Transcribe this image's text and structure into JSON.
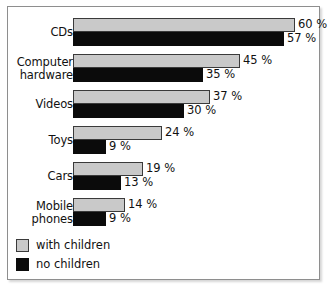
{
  "chart_data": {
    "type": "bar",
    "orientation": "horizontal",
    "title": "",
    "subtitle": "",
    "xlabel": "",
    "ylabel": "",
    "xlim": [
      0,
      67
    ],
    "grid": false,
    "legend_position": "bottom-left",
    "value_suffix": "%",
    "categories": [
      "CDs",
      "Computer\nhardware",
      "Videos",
      "Toys",
      "Cars",
      "Mobile\nphones"
    ],
    "series": [
      {
        "name": "with children",
        "color": "#c9c9c9",
        "values": [
          60,
          45,
          37,
          24,
          19,
          14
        ],
        "labels": [
          "60 %",
          "45 %",
          "37 %",
          "24 %",
          "19 %",
          "14 %"
        ]
      },
      {
        "name": "no children",
        "color": "#0b0b0b",
        "values": [
          57,
          35,
          30,
          9,
          13,
          9
        ],
        "labels": [
          "57 %",
          "35 %",
          "30 %",
          "9 %",
          "13 %",
          "9 %"
        ]
      }
    ]
  },
  "legend": {
    "items": [
      {
        "label": "with children",
        "swatch": "gray-swatch"
      },
      {
        "label": "no children",
        "swatch": "black-swatch"
      }
    ]
  }
}
